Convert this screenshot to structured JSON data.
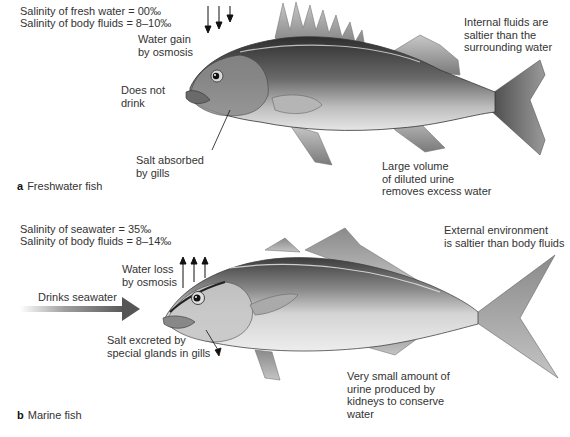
{
  "panel_a": {
    "caption_letter": "a",
    "caption_text": "Freshwater fish",
    "salinity_env": "Salinity of fresh water = 00‰",
    "salinity_body": "Salinity of body fluids = 8–10‰",
    "water_movement": "Water gain\nby osmosis",
    "drinking": "Does not\ndrink",
    "salt": "Salt absorbed\nby gills",
    "fluids": "Internal fluids are\nsaltier than the\nsurrounding water",
    "urine": "Large volume\nof diluted urine\nremoves excess water",
    "arrow_direction": "down"
  },
  "panel_b": {
    "caption_letter": "b",
    "caption_text": "Marine fish",
    "salinity_env": "Salinity of seawater = 35‰",
    "salinity_body": "Salinity of body fluids = 8–14‰",
    "water_movement": "Water loss\nby osmosis",
    "drinking": "Drinks seawater",
    "salt": "Salt excreted by\nspecial glands in gills",
    "environment": "External environment\nis saltier than body fluids",
    "urine": "Very small amount of\nurine produced by\nkidneys to conserve\nwater",
    "arrow_direction": "up"
  },
  "colors": {
    "background": "#ffffff",
    "text": "#333333",
    "fish_dark": "#3a3a3a",
    "fish_mid": "#8a8a8a",
    "fish_light": "#e0e0e0",
    "arrow_drink": "#555555"
  }
}
